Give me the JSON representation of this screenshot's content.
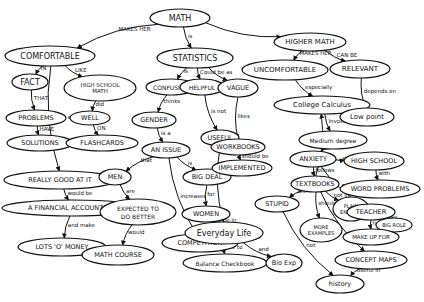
{
  "colors": {
    "ink": "#111111",
    "background": "#ffffff"
  },
  "nodes": [
    {
      "id": "math",
      "label": "MATH"
    },
    {
      "id": "comfortable",
      "label": "COMFORTABLE"
    },
    {
      "id": "fact",
      "label": "FACT"
    },
    {
      "id": "problems",
      "label": "PROBLEMS"
    },
    {
      "id": "solutions",
      "label": "SOLUTIONS"
    },
    {
      "id": "hs_math",
      "label": "HIGH SCHOOL MATH"
    },
    {
      "id": "well",
      "label": "WELL"
    },
    {
      "id": "flashcards",
      "label": "FLASHCARDS"
    },
    {
      "id": "really_good",
      "label": "REALLY GOOD AT IT"
    },
    {
      "id": "accountant",
      "label": "A FINANCIAL ACCOUNTANT"
    },
    {
      "id": "money",
      "label": "LOTS 'O' MONEY"
    },
    {
      "id": "statistics",
      "label": "STATISTICS"
    },
    {
      "id": "confusing",
      "label": "CONFUSING"
    },
    {
      "id": "helpful",
      "label": "HELPFUL"
    },
    {
      "id": "vague",
      "label": "VAGUE"
    },
    {
      "id": "gender",
      "label": "GENDER"
    },
    {
      "id": "an_issue",
      "label": "AN ISSUE"
    },
    {
      "id": "men",
      "label": "MEN"
    },
    {
      "id": "expected",
      "label": "EXPECTED TO DO BETTER"
    },
    {
      "id": "math_course",
      "label": "MATH COURSE"
    },
    {
      "id": "big_deal",
      "label": "BIG DEAL"
    },
    {
      "id": "women",
      "label": "WOMEN"
    },
    {
      "id": "competition",
      "label": "COMPETITION"
    },
    {
      "id": "useful",
      "label": "USEFUL"
    },
    {
      "id": "higher_math",
      "label": "HIGHER MATH"
    },
    {
      "id": "uncomfortable",
      "label": "UNCOMFORTABLE"
    },
    {
      "id": "relevant",
      "label": "RELEVANT"
    },
    {
      "id": "college_calc",
      "label": "College Calculus"
    },
    {
      "id": "low_point",
      "label": "Low point"
    },
    {
      "id": "medium_degree",
      "label": "Medium degree"
    },
    {
      "id": "anxiety",
      "label": "ANXIETY"
    },
    {
      "id": "high_school",
      "label": "HIGH SCHOOL"
    },
    {
      "id": "word_problems",
      "label": "WORD PROBLEMS"
    },
    {
      "id": "workbooks",
      "label": "WORKBOOKS"
    },
    {
      "id": "implemented",
      "label": "IMPLEMENTED"
    },
    {
      "id": "textbooks",
      "label": "TEXTBOOKS"
    },
    {
      "id": "stupid",
      "label": "STUPID"
    },
    {
      "id": "plain_english",
      "label": "PLAIN ENGLISH"
    },
    {
      "id": "more_examples",
      "label": "MORE EXAMPLES"
    },
    {
      "id": "teacher",
      "label": "TEACHER"
    },
    {
      "id": "big_role",
      "label": "BIG ROLE"
    },
    {
      "id": "make_up_for",
      "label": "MAKE UP FOR"
    },
    {
      "id": "concept_maps",
      "label": "CONCEPT MAPS"
    },
    {
      "id": "history",
      "label": "history"
    },
    {
      "id": "everyday_life",
      "label": "Everyday Life"
    },
    {
      "id": "balance_checkbook",
      "label": "Balance Checkbook"
    },
    {
      "id": "bio_exp",
      "label": "Bio Exp"
    }
  ],
  "edges": [
    {
      "from": "math",
      "to": "comfortable",
      "label": "MAKES HER"
    },
    {
      "from": "comfortable",
      "to": "fact",
      "label": "IN"
    },
    {
      "from": "fact",
      "to": "problems",
      "label": "THAT"
    },
    {
      "from": "problems",
      "to": "solutions",
      "label": "HAVE"
    },
    {
      "from": "comfortable",
      "to": "hs_math",
      "label": "LIKE"
    },
    {
      "from": "hs_math",
      "to": "well",
      "label": "did"
    },
    {
      "from": "well",
      "to": "flashcards",
      "label": "ON"
    },
    {
      "from": "comfortable",
      "to": "really_good",
      "label": "If she was"
    },
    {
      "from": "really_good",
      "to": "accountant",
      "label": "would be"
    },
    {
      "from": "accountant",
      "to": "money",
      "label": "and make"
    },
    {
      "from": "math",
      "to": "statistics",
      "label": "is"
    },
    {
      "from": "statistics",
      "to": "confusing",
      "label": "is"
    },
    {
      "from": "statistics",
      "to": "helpful",
      "label": "Could be as"
    },
    {
      "from": "statistics",
      "to": "vague",
      "label": ""
    },
    {
      "from": "confusing",
      "to": "gender",
      "label": "thinks"
    },
    {
      "from": "gender",
      "to": "an_issue",
      "label": "is a"
    },
    {
      "from": "an_issue",
      "to": "men",
      "label": "that"
    },
    {
      "from": "men",
      "to": "expected",
      "label": "are"
    },
    {
      "from": "expected",
      "to": "math_course",
      "label": "would"
    },
    {
      "from": "an_issue",
      "to": "big_deal",
      "label": "is"
    },
    {
      "from": "big_deal",
      "to": "women",
      "label": "for"
    },
    {
      "from": "an_issue",
      "to": "competition",
      "label": "increases"
    },
    {
      "from": "helpful",
      "to": "useful",
      "label": "is not"
    },
    {
      "from": "math",
      "to": "higher_math",
      "label": ""
    },
    {
      "from": "higher_math",
      "to": "uncomfortable",
      "label": "MAKES HER"
    },
    {
      "from": "higher_math",
      "to": "relevant",
      "label": "CAN BE"
    },
    {
      "from": "uncomfortable",
      "to": "college_calc",
      "label": "especially"
    },
    {
      "from": "relevant",
      "to": "low_point",
      "label": "depends on"
    },
    {
      "from": "college_calc",
      "to": "low_point",
      "label": "was a"
    },
    {
      "from": "college_calc",
      "to": "medium_degree",
      "label": "Invokes"
    },
    {
      "from": "medium_degree",
      "to": "anxiety",
      "label": "of"
    },
    {
      "from": "anxiety",
      "to": "high_school",
      "label": "started"
    },
    {
      "from": "high_school",
      "to": "word_problems",
      "label": "with"
    },
    {
      "from": "vague",
      "to": "workbooks",
      "label": "likes"
    },
    {
      "from": "workbooks",
      "to": "implemented",
      "label": "should be"
    },
    {
      "from": "anxiety",
      "to": "textbooks",
      "label": "follows"
    },
    {
      "from": "textbooks",
      "to": "stupid",
      "label": "are"
    },
    {
      "from": "textbooks",
      "to": "plain_english",
      "label": "not in"
    },
    {
      "from": "textbooks",
      "to": "more_examples",
      "label": "should have"
    },
    {
      "from": "anxiety",
      "to": "teacher",
      "label": "FOR"
    },
    {
      "from": "teacher",
      "to": "big_role",
      "label": "play"
    },
    {
      "from": "teacher",
      "to": "make_up_for",
      "label": "has to"
    },
    {
      "from": "textbooks",
      "to": "concept_maps",
      "label": ""
    },
    {
      "from": "concept_maps",
      "to": "history",
      "label": "useful in"
    },
    {
      "from": "stupid",
      "to": "history",
      "label": "not"
    },
    {
      "from": "useful",
      "to": "everyday_life",
      "label": "in"
    },
    {
      "from": "women",
      "to": "everyday_life",
      "label": "to be in"
    },
    {
      "from": "everyday_life",
      "to": "balance_checkbook",
      "label": "like to"
    },
    {
      "from": "everyday_life",
      "to": "bio_exp",
      "label": "and"
    },
    {
      "from": "textbooks",
      "to": "college_calc",
      "label": "in"
    }
  ]
}
